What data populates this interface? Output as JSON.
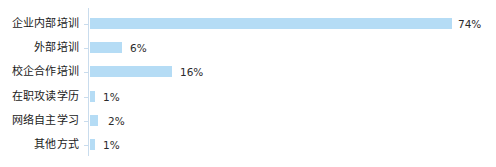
{
  "chart_data": {
    "type": "bar",
    "orientation": "horizontal",
    "title": "",
    "subtitle": "",
    "xlabel": "",
    "ylabel": "",
    "grid": false,
    "legend": null,
    "xlim": [
      0,
      74
    ],
    "axis_line_color": "#c9dced",
    "bar_color": "#b5dcf5",
    "label_color": "#1a1a1a",
    "value_color": "#2b2b2b",
    "value_suffix": "%",
    "categories": [
      "企业内部培训",
      "外部培训",
      "校企合作培训",
      "在职攻读学历",
      "网络自主学习",
      "其他方式"
    ],
    "values": [
      74,
      6,
      16,
      1,
      2,
      1
    ],
    "value_labels": [
      "74%",
      "6%",
      "16%",
      "1%",
      "2%",
      "1%"
    ]
  },
  "rows": [
    {
      "label": "企业内部培训",
      "value": 74,
      "value_label": "74%",
      "top": 12,
      "bar_width": 362,
      "label_left": 458
    },
    {
      "label": "外部培训",
      "value": 6,
      "value_label": "6%",
      "top": 36,
      "bar_width": 32,
      "label_left": 130
    },
    {
      "label": "校企合作培训",
      "value": 16,
      "value_label": "16%",
      "top": 60,
      "bar_width": 82,
      "label_left": 180
    },
    {
      "label": "在职攻读学历",
      "value": 1,
      "value_label": "1%",
      "top": 85,
      "bar_width": 5,
      "label_left": 103
    },
    {
      "label": "网络自主学习",
      "value": 2,
      "value_label": "2%",
      "top": 109,
      "bar_width": 8,
      "label_left": 108
    },
    {
      "label": "其他方式",
      "value": 1,
      "value_label": "1%",
      "top": 133,
      "bar_width": 5,
      "label_left": 103
    }
  ]
}
